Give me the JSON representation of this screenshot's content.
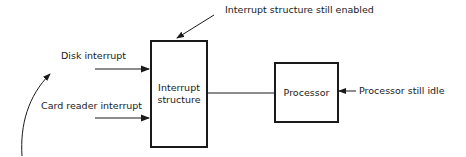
{
  "diagram": {
    "blocks": {
      "interrupt_structure": {
        "line1": "Interrupt",
        "line2": "structure"
      },
      "processor": {
        "label": "Processor"
      }
    },
    "inputs": {
      "disk": "Disk interrupt",
      "card_reader": "Card reader interrupt"
    },
    "annotations": {
      "interrupt_enabled": "Interrupt structure still enabled",
      "processor_idle": "Processor still idle"
    },
    "colors": {
      "stroke": "#1a1a1a",
      "background": "#ffffff"
    }
  }
}
